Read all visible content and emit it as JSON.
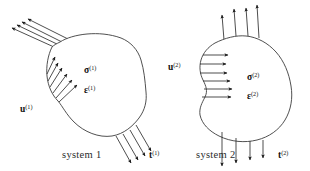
{
  "figure": {
    "background_color": "#ffffff",
    "line_color": "#3c3c3c",
    "arrow_color": "#1a1a1a",
    "text_color": "#111111",
    "width": 310,
    "height": 171
  },
  "systems": [
    {
      "id": "system-1",
      "caption": "system 1",
      "caption_x": 62,
      "caption_y": 158,
      "displacement_label": {
        "symbol": "u",
        "superscript": "(1)",
        "x": 20,
        "y": 112
      },
      "stress_label": {
        "symbol": "σ",
        "superscript": "(1)",
        "x": 84,
        "y": 73
      },
      "strain_label": {
        "symbol": "ε",
        "superscript": "(1)",
        "x": 84,
        "y": 93
      },
      "traction_label": {
        "symbol": "t",
        "superscript": "(1)",
        "x": 149,
        "y": 158
      },
      "upper_left_arrow_count": 4,
      "left_edge_arrow_count": 6,
      "lower_right_arrow_count": 4
    },
    {
      "id": "system-2",
      "caption": "system 2",
      "caption_x": 196,
      "caption_y": 158,
      "displacement_label": {
        "symbol": "u",
        "superscript": "(2)",
        "x": 168,
        "y": 70
      },
      "stress_label": {
        "symbol": "σ",
        "superscript": "(2)",
        "x": 247,
        "y": 80
      },
      "strain_label": {
        "symbol": "ε",
        "superscript": "(2)",
        "x": 247,
        "y": 99
      },
      "traction_label": {
        "symbol": "t",
        "superscript": "(2)",
        "x": 278,
        "y": 158
      },
      "top_arrow_count": 4,
      "left_edge_arrow_count": 6,
      "bottom_arrow_count": 4
    }
  ],
  "geometry": {
    "blob1_path": "M 52 47 C 48 55 46 66 47 76 C 48 86 52 95 58 101 C 63 107 66 114 74 122 C 84 132 99 138 112 136 C 124 134 133 126 139 118 C 145 110 147 101 146 92 C 145 80 144 70 141 60 C 138 50 131 42 121 38 C 110 34 98 33 87 34 C 76 35 66 38 60 42 C 56 44 54 45 52 47 Z",
    "blob2_path": "M 215 43 C 208 47 203 53 201 60 C 199 67 200 74 203 80 C 206 86 208 91 205 97 C 202 103 199 108 200 115 C 202 124 209 131 219 136 C 231 142 245 143 257 140 C 269 137 279 130 285 120 C 291 110 293 98 291 86 C 289 73 284 61 276 52 C 268 43 257 37 246 36 C 236 35 225 38 215 43 Z",
    "blob1_upper_left_arrows": [
      {
        "x1": 70,
        "y1": 40,
        "x2": 28,
        "y2": 19
      },
      {
        "x1": 64,
        "y1": 43,
        "x2": 22,
        "y2": 22
      },
      {
        "x1": 59,
        "y1": 45,
        "x2": 17,
        "y2": 25
      },
      {
        "x1": 54,
        "y1": 47,
        "x2": 12,
        "y2": 28
      }
    ],
    "blob1_left_arrows": [
      {
        "x1": 47,
        "y1": 74,
        "x2": 55,
        "y2": 57
      },
      {
        "x1": 48,
        "y1": 81,
        "x2": 58,
        "y2": 63
      },
      {
        "x1": 50,
        "y1": 87,
        "x2": 62,
        "y2": 68
      },
      {
        "x1": 53,
        "y1": 93,
        "x2": 67,
        "y2": 74
      },
      {
        "x1": 56,
        "y1": 98,
        "x2": 72,
        "y2": 80
      },
      {
        "x1": 59,
        "y1": 102,
        "x2": 77,
        "y2": 85
      }
    ],
    "blob1_traction_arrows": [
      {
        "x1": 116,
        "y1": 136,
        "x2": 131,
        "y2": 163
      },
      {
        "x1": 123,
        "y1": 134,
        "x2": 138,
        "y2": 160
      },
      {
        "x1": 130,
        "y1": 130,
        "x2": 145,
        "y2": 156
      },
      {
        "x1": 136,
        "y1": 125,
        "x2": 151,
        "y2": 151
      }
    ],
    "blob2_top_arrows": [
      {
        "x1": 224,
        "y1": 40,
        "x2": 222,
        "y2": 15
      },
      {
        "x1": 236,
        "y1": 36,
        "x2": 234,
        "y2": 9
      },
      {
        "x1": 248,
        "y1": 36,
        "x2": 246,
        "y2": 8
      },
      {
        "x1": 259,
        "y1": 38,
        "x2": 257,
        "y2": 5
      }
    ],
    "blob2_left_arrows": [
      {
        "x1": 203,
        "y1": 55,
        "x2": 228,
        "y2": 55
      },
      {
        "x1": 200,
        "y1": 64,
        "x2": 226,
        "y2": 64
      },
      {
        "x1": 200,
        "y1": 73,
        "x2": 227,
        "y2": 73
      },
      {
        "x1": 203,
        "y1": 81,
        "x2": 230,
        "y2": 81
      },
      {
        "x1": 204,
        "y1": 89,
        "x2": 232,
        "y2": 89
      },
      {
        "x1": 202,
        "y1": 97,
        "x2": 231,
        "y2": 97
      }
    ],
    "blob2_traction_arrows": [
      {
        "x1": 222,
        "y1": 132,
        "x2": 222,
        "y2": 166
      },
      {
        "x1": 236,
        "y1": 138,
        "x2": 236,
        "y2": 163
      },
      {
        "x1": 250,
        "y1": 141,
        "x2": 250,
        "y2": 160
      },
      {
        "x1": 263,
        "y1": 140,
        "x2": 263,
        "y2": 158
      }
    ]
  }
}
